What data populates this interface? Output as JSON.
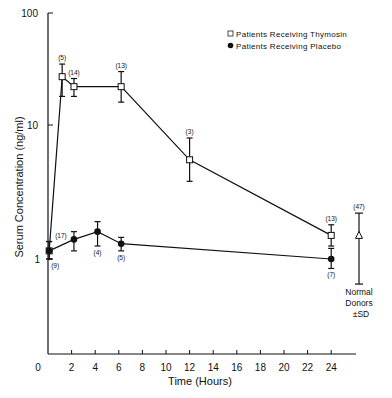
{
  "chart_data": {
    "type": "line",
    "title": "",
    "xlabel": "Time (Hours)",
    "ylabel": "Serum Concentration (ng/ml)",
    "yscale": "log",
    "ylim": [
      0.1,
      100
    ],
    "xlim": [
      0,
      26
    ],
    "x_ticks": [
      0,
      2,
      4,
      6,
      8,
      10,
      12,
      14,
      16,
      18,
      20,
      22,
      24
    ],
    "y_ticks": [
      1,
      10,
      100
    ],
    "y_tick_labels": [
      "1",
      "10",
      "100"
    ],
    "legend": {
      "position": "top-right",
      "entries": [
        {
          "label": "Patients Receiving Thymosin",
          "marker": "open-square"
        },
        {
          "label": "Patients Receiving Placebo",
          "marker": "filled-circle"
        }
      ]
    },
    "series": [
      {
        "name": "Patients Receiving Thymosin",
        "marker": "open-square",
        "points": [
          {
            "x": 0.1,
            "y": 1.15,
            "err_low": 1.0,
            "err_high": 1.35,
            "n": ""
          },
          {
            "x": 1.2,
            "y": 27,
            "err_low": 18,
            "err_high": 35,
            "n": "(5)"
          },
          {
            "x": 2.2,
            "y": 22,
            "err_low": 18,
            "err_high": 26,
            "n": "(14)"
          },
          {
            "x": 6.2,
            "y": 22,
            "err_low": 16,
            "err_high": 30,
            "n": "(13)"
          },
          {
            "x": 12,
            "y": 5.5,
            "err_low": 3.8,
            "err_high": 8,
            "n": "(3)"
          },
          {
            "x": 24,
            "y": 1.5,
            "err_low": 1.25,
            "err_high": 1.8,
            "n": "(13)"
          }
        ]
      },
      {
        "name": "Patients Receiving Placebo",
        "marker": "filled-circle",
        "points": [
          {
            "x": 0.1,
            "y": 1.15,
            "err_low": 1.0,
            "err_high": 1.35,
            "n": "(17)",
            "n_below": "(9)"
          },
          {
            "x": 2.2,
            "y": 1.4,
            "err_low": 1.15,
            "err_high": 1.6,
            "n": ""
          },
          {
            "x": 4.2,
            "y": 1.6,
            "err_low": 1.25,
            "err_high": 1.9,
            "n": "(4)"
          },
          {
            "x": 6.2,
            "y": 1.3,
            "err_low": 1.15,
            "err_high": 1.45,
            "n": "(5)"
          },
          {
            "x": 24,
            "y": 1.0,
            "err_low": 0.85,
            "err_high": 1.2,
            "n": "(7)"
          }
        ]
      }
    ],
    "reference": {
      "label_lines": [
        "Normal",
        "Donors",
        "±SD"
      ],
      "marker": "open-triangle",
      "y": 1.5,
      "err_low": 0.65,
      "err_high": 2.2,
      "n": "(47)"
    }
  }
}
